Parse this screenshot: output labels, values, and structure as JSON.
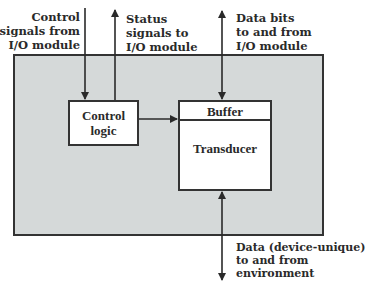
{
  "diagram": {
    "type": "block-diagram",
    "title": "",
    "colors": {
      "device_fill": "#d5d9d9",
      "box_fill": "#ffffff",
      "stroke": "#333333",
      "text": "#2a2a2a"
    },
    "blocks": {
      "control_logic": {
        "lines": [
          "Control",
          "logic"
        ]
      },
      "buffer": {
        "label": "Buffer"
      },
      "transducer": {
        "label": "Transducer"
      }
    },
    "signals": {
      "control_in": {
        "lines": [
          "Control",
          "signals from",
          "I/O module"
        ],
        "direction": "in"
      },
      "status_out": {
        "lines": [
          "Status",
          "signals to",
          "I/O module"
        ],
        "direction": "out"
      },
      "data_bits": {
        "lines": [
          "Data bits",
          "to and from",
          "I/O module"
        ],
        "direction": "bidirectional"
      },
      "data_env": {
        "lines": [
          "Data (device-unique)",
          "to and from",
          "environment"
        ],
        "direction": "bidirectional"
      }
    },
    "edges": [
      {
        "from": "I/O module",
        "to": "Control logic",
        "label": "Control signals from I/O module"
      },
      {
        "from": "Control logic",
        "to": "I/O module",
        "label": "Status signals to I/O module"
      },
      {
        "from": "Control logic",
        "to": "Buffer"
      },
      {
        "from": "Buffer",
        "to": "I/O module",
        "label": "Data bits to and from I/O module",
        "bidirectional": true
      },
      {
        "from": "Transducer",
        "to": "environment",
        "label": "Data (device-unique) to and from environment",
        "bidirectional": true
      }
    ]
  }
}
